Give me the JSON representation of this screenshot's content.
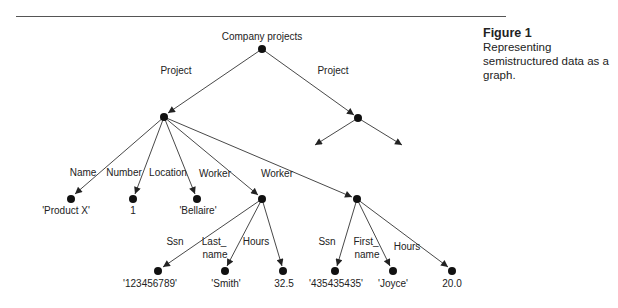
{
  "caption": {
    "figure_label": "Figure 1",
    "description": "Representing semistructured data as a graph."
  },
  "graph": {
    "root_label": "Company projects",
    "nodes": [
      {
        "id": "root",
        "x": 262,
        "y": 49
      },
      {
        "id": "proj1",
        "x": 164,
        "y": 117
      },
      {
        "id": "proj2",
        "x": 358,
        "y": 118
      },
      {
        "id": "name",
        "x": 71,
        "y": 199,
        "value": "'Product X'"
      },
      {
        "id": "number",
        "x": 133,
        "y": 199,
        "value": "1"
      },
      {
        "id": "location",
        "x": 197,
        "y": 199,
        "value": "'Bellaire'"
      },
      {
        "id": "worker1",
        "x": 262,
        "y": 199
      },
      {
        "id": "worker2",
        "x": 357,
        "y": 199
      },
      {
        "id": "ssn1",
        "x": 158,
        "y": 271,
        "value": "'123456789'"
      },
      {
        "id": "lname",
        "x": 225,
        "y": 271,
        "value": "'Smith'"
      },
      {
        "id": "hours1",
        "x": 283,
        "y": 271,
        "value": "32.5"
      },
      {
        "id": "ssn2",
        "x": 335,
        "y": 271,
        "value": "'435435435'"
      },
      {
        "id": "fname",
        "x": 393,
        "y": 271,
        "value": "'Joyce'"
      },
      {
        "id": "hours2",
        "x": 452,
        "y": 271,
        "value": "20.0"
      }
    ],
    "edges": [
      {
        "from": "root",
        "to": "proj1",
        "label": "Project"
      },
      {
        "from": "root",
        "to": "proj2",
        "label": "Project"
      },
      {
        "from": "proj1",
        "to": "name",
        "label": "Name"
      },
      {
        "from": "proj1",
        "to": "number",
        "label": "Number"
      },
      {
        "from": "proj1",
        "to": "location",
        "label": "Location"
      },
      {
        "from": "proj1",
        "to": "worker1",
        "label": "Worker"
      },
      {
        "from": "proj1",
        "to": "worker2",
        "label": "Worker"
      },
      {
        "from": "worker1",
        "to": "ssn1",
        "label": "Ssn"
      },
      {
        "from": "worker1",
        "to": "lname",
        "label": "Last_ name"
      },
      {
        "from": "worker1",
        "to": "hours1",
        "label": "Hours"
      },
      {
        "from": "worker2",
        "to": "ssn2",
        "label": "Ssn"
      },
      {
        "from": "worker2",
        "to": "fname",
        "label": "First_ name"
      },
      {
        "from": "worker2",
        "to": "hours2",
        "label": "Hours"
      }
    ],
    "edge_labels": {
      "project_left": "Project",
      "project_right": "Project",
      "name": "Name",
      "number": "Number",
      "location": "Location",
      "worker1": "Worker",
      "worker2": "Worker",
      "ssn1": "Ssn",
      "lname_1": "Last_",
      "lname_2": "name",
      "hours1": "Hours",
      "ssn2": "Ssn",
      "fname_1": "First_",
      "fname_2": "name",
      "hours2": "Hours"
    },
    "values": {
      "name": "'Product X'",
      "number": "1",
      "location": "'Bellaire'",
      "ssn1": "'123456789'",
      "lname": "'Smith'",
      "hours1": "32.5",
      "ssn2": "'435435435'",
      "fname": "'Joyce'",
      "hours2": "20.0"
    },
    "colors": {
      "edge": "#333333",
      "node": "#111111",
      "text": "#222222"
    }
  }
}
